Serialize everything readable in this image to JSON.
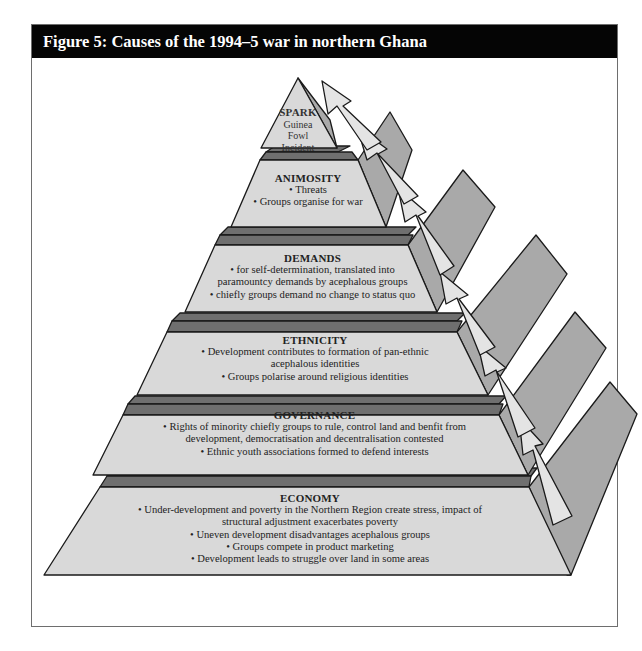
{
  "figure": {
    "title": "Figure 5: Causes of the 1994–5 war in northern Ghana"
  },
  "colors": {
    "header_bg": "#050505",
    "header_text": "#ffffff",
    "face_fill": "#d9d9d9",
    "side_fill": "#a9a9a9",
    "ledge_fill": "#6f6f6f",
    "arrow_fill": "#e4e4e4",
    "outline": "#1a1a1a"
  },
  "pyramid": {
    "direction_arrows": "upward arrows along right side indicating escalation from base to apex",
    "layers": [
      {
        "id": "spark",
        "title": "SPARK",
        "lines": [
          "Guinea",
          "Fowl",
          "Incident"
        ]
      },
      {
        "id": "animosity",
        "title": "ANIMOSITY",
        "lines": [
          "• Threats",
          "• Groups organise for war"
        ]
      },
      {
        "id": "demands",
        "title": "DEMANDS",
        "lines": [
          "• for self-determination, translated into",
          "paramountcy demands by acephalous groups",
          "• chiefly groups demand no change to status quo"
        ]
      },
      {
        "id": "ethnicity",
        "title": "ETHNICITY",
        "lines": [
          "• Development contributes to formation of pan-ethnic",
          "acephalous identities",
          "• Groups polarise around religious identities"
        ]
      },
      {
        "id": "governance",
        "title": "GOVERNANCE",
        "lines": [
          "• Rights of minority chiefly groups to rule, control land and benfit from",
          "development, democratisation and decentralisation contested",
          "• Ethnic youth associations formed to defend interests"
        ]
      },
      {
        "id": "economy",
        "title": "ECONOMY",
        "lines": [
          "• Under-development and poverty in the Northern Region create stress, impact of",
          "structural adjustment exacerbates poverty",
          "• Uneven development disadvantages acephalous groups",
          "• Groups compete in product marketing",
          "• Development leads to struggle over land in some areas"
        ]
      }
    ]
  }
}
